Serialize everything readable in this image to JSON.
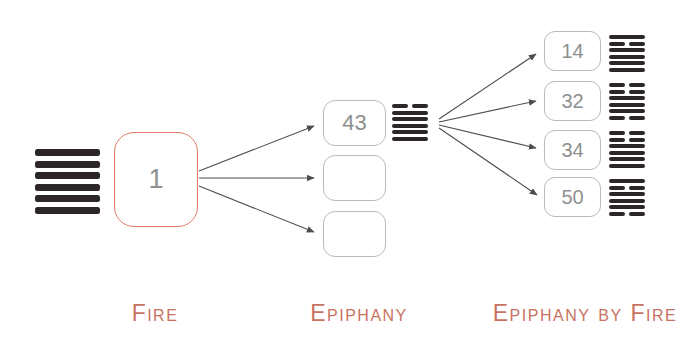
{
  "diagram": {
    "columns": [
      {
        "label": "Fire"
      },
      {
        "label": "Epiphany"
      },
      {
        "label": "Epiphany by Fire"
      }
    ],
    "source": {
      "number": "1",
      "hexagram_lines": [
        "solid",
        "solid",
        "solid",
        "solid",
        "solid",
        "solid"
      ]
    },
    "middle": {
      "boxes": [
        {
          "value": "43",
          "hexagram_lines": [
            "broken",
            "solid",
            "solid",
            "solid",
            "solid",
            "solid"
          ]
        },
        {
          "value": ""
        },
        {
          "value": ""
        }
      ]
    },
    "right": {
      "boxes": [
        {
          "value": "14",
          "hexagram_lines": [
            "solid",
            "broken",
            "solid",
            "solid",
            "solid",
            "solid"
          ]
        },
        {
          "value": "32",
          "hexagram_lines": [
            "broken",
            "broken",
            "solid",
            "solid",
            "solid",
            "broken"
          ]
        },
        {
          "value": "34",
          "hexagram_lines": [
            "broken",
            "broken",
            "solid",
            "solid",
            "solid",
            "solid"
          ]
        },
        {
          "value": "50",
          "hexagram_lines": [
            "solid",
            "broken",
            "solid",
            "solid",
            "solid",
            "broken"
          ]
        }
      ]
    },
    "colors": {
      "highlight_border": "#e2796b",
      "box_border": "#b5c0b3",
      "number_text": "#8d908e",
      "label_text": "#c97261",
      "hexagram_line": "#2c2628",
      "arrow": "#4d4d4d"
    }
  }
}
